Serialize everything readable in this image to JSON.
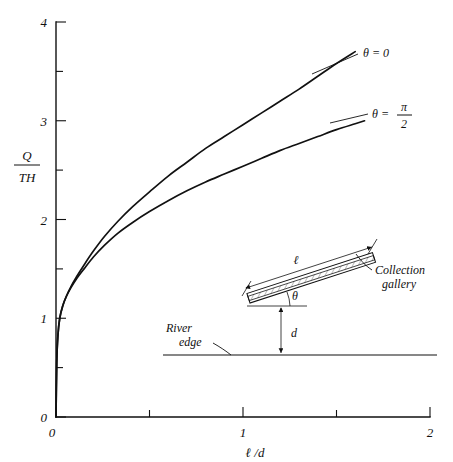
{
  "figure": {
    "kind": "line-chart-with-inset-diagram",
    "background_color": "#ffffff",
    "ink_color": "#111111"
  },
  "chart_data": {
    "type": "line",
    "title": "",
    "subtitle": "",
    "xlabel_numerator": "ℓ",
    "xlabel_denominator": "d",
    "xlabel": "ℓ /d",
    "ylabel_numerator": "Q",
    "ylabel_denominator": "TH",
    "ylabel": "Q/TH",
    "xlim": [
      0,
      2
    ],
    "ylim": [
      0,
      4
    ],
    "xticks": [
      0,
      1,
      2
    ],
    "xtick_labels": [
      "0",
      "1",
      "2"
    ],
    "x_minor_ticks": [
      0.5,
      1.5
    ],
    "yticks": [
      0,
      1,
      2,
      3,
      4
    ],
    "ytick_labels": [
      "0",
      "1",
      "2",
      "3",
      "4"
    ],
    "y_minor_ticks": [
      0.5,
      1.5,
      2.5,
      3.5
    ],
    "grid": false,
    "legend_position": "inline-curve-labels",
    "series": [
      {
        "name": "θ = 0",
        "label": "θ = 0",
        "label_type": "plain",
        "x": [
          0.0,
          0.004,
          0.01,
          0.02,
          0.035,
          0.055,
          0.08,
          0.11,
          0.15,
          0.2,
          0.26,
          0.33,
          0.41,
          0.5,
          0.6,
          0.7,
          0.8,
          0.9,
          1.0,
          1.1,
          1.2,
          1.3,
          1.4,
          1.5,
          1.6
        ],
        "y": [
          0.0,
          0.55,
          0.82,
          1.0,
          1.12,
          1.22,
          1.32,
          1.42,
          1.54,
          1.68,
          1.83,
          1.98,
          2.13,
          2.28,
          2.44,
          2.58,
          2.72,
          2.84,
          2.96,
          3.08,
          3.2,
          3.32,
          3.45,
          3.58,
          3.7
        ]
      },
      {
        "name": "θ = π/2",
        "label": "θ =",
        "label_type": "fraction",
        "label_numerator": "π",
        "label_denominator": "2",
        "x": [
          0.0,
          0.004,
          0.01,
          0.02,
          0.035,
          0.055,
          0.08,
          0.11,
          0.15,
          0.2,
          0.26,
          0.33,
          0.41,
          0.5,
          0.6,
          0.7,
          0.8,
          0.9,
          1.0,
          1.1,
          1.2,
          1.3,
          1.4,
          1.5,
          1.6,
          1.65
        ],
        "y": [
          0.0,
          0.55,
          0.82,
          1.0,
          1.12,
          1.22,
          1.31,
          1.4,
          1.5,
          1.62,
          1.74,
          1.86,
          1.97,
          2.08,
          2.19,
          2.29,
          2.38,
          2.46,
          2.54,
          2.62,
          2.7,
          2.77,
          2.84,
          2.91,
          2.97,
          3.0
        ]
      }
    ],
    "annotations": [
      {
        "text": "θ = 0",
        "x": 1.72,
        "y": 3.66
      },
      {
        "text": "θ = π/2",
        "x": 1.8,
        "y": 3.0
      }
    ]
  },
  "inset": {
    "name": "collection-gallery-schematic",
    "labels": {
      "length": "ℓ",
      "angle": "θ",
      "depth": "d",
      "gallery_line1": "Collection",
      "gallery_line2": "gallery",
      "river_line1": "River",
      "river_line2": "edge"
    }
  }
}
